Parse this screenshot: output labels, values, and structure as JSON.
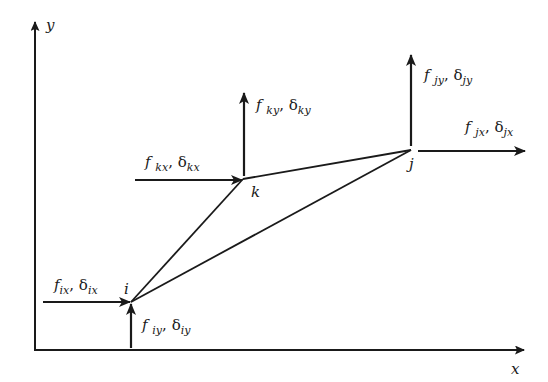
{
  "diagram": {
    "type": "triangular-element-nodal-forces",
    "axes": {
      "x_label": "x",
      "y_label": "y"
    },
    "nodes": [
      {
        "id": "i",
        "label": "i"
      },
      {
        "id": "k",
        "label": "k"
      },
      {
        "id": "j",
        "label": "j"
      }
    ],
    "forces": {
      "ix": {
        "f": "f",
        "f_sub": "ix",
        "sep": ",",
        "d": "δ",
        "d_sub": "ix"
      },
      "iy": {
        "f": "f",
        "f_sub": "iy",
        "sep": ",",
        "d": "δ",
        "d_sub": "iy"
      },
      "kx": {
        "f": "f",
        "f_sub": "kx",
        "sep": ",",
        "d": "δ",
        "d_sub": "kx"
      },
      "ky": {
        "f": "f",
        "f_sub": "ky",
        "sep": ",",
        "d": "δ",
        "d_sub": "ky"
      },
      "jx": {
        "f": "f",
        "f_sub": "jx",
        "sep": ",",
        "d": "δ",
        "d_sub": "jx"
      },
      "jy": {
        "f": "f",
        "f_sub": "jy",
        "sep": ",",
        "d": "δ",
        "d_sub": "jy"
      }
    },
    "colors": {
      "stroke": "#1a1a1a",
      "background": "#ffffff"
    }
  }
}
